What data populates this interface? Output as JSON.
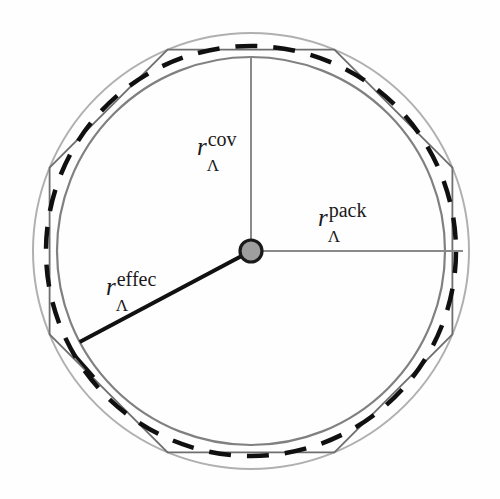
{
  "figure": {
    "background_color": "#fefefe",
    "center": {
      "x": 251,
      "y": 251,
      "dot_radius": 11,
      "fill": "#9e9e9e",
      "stroke": "#1a1a1a"
    },
    "labels": {
      "cov": {
        "symbol": "r",
        "subscript": "Λ",
        "superscript": "cov"
      },
      "pack": {
        "symbol": "r",
        "subscript": "Λ",
        "superscript": "pack"
      },
      "effec": {
        "symbol": "r",
        "subscript": "Λ",
        "superscript": "effec"
      }
    },
    "colors": {
      "outer_circle": "#b0b0b0",
      "inner_circle": "#808080",
      "dashed_circle": "#101010",
      "polygon": "#6e6e6e",
      "leader_line_light": "#8a8a8a",
      "leader_line_dark": "#111111"
    }
  },
  "chart_data": {
    "type": "scatter",
    "xlabel": "",
    "ylabel": "",
    "center": [
      251,
      251
    ],
    "circles": [
      {
        "name": "outer-packing-circle",
        "role": "outer boundary / polygon circumcircle",
        "radius_px": 218,
        "style": "solid",
        "color": "#b0b0b0",
        "width": 2
      },
      {
        "name": "dashed-effective-circle",
        "role": "effective radius",
        "radius_px": 205,
        "style": "dashed",
        "color": "#101010",
        "width": 4.5
      },
      {
        "name": "inner-covalent-circle",
        "role": "covalent / packing radius",
        "radius_px": 194,
        "style": "solid",
        "color": "#808080",
        "width": 2.2
      }
    ],
    "polygon": {
      "name": "inscribed-octagon",
      "sides": 8,
      "circumradius_px": 218,
      "rotation_deg": 22.5,
      "color": "#6e6e6e",
      "width": 1.8
    },
    "radii_lines": [
      {
        "label": "cov",
        "angle_deg": 90,
        "length_px": 194,
        "color": "#8a8a8a",
        "width": 2
      },
      {
        "label": "pack",
        "angle_deg": 0,
        "length_px": 212,
        "color": "#8a8a8a",
        "width": 2
      },
      {
        "label": "effec",
        "angle_deg": 208,
        "length_px": 194,
        "color": "#111111",
        "width": 4
      }
    ],
    "annotations": [
      "r_Λ^cov",
      "r_Λ^pack",
      "r_Λ^effec"
    ],
    "grid": false,
    "legend": "none"
  }
}
